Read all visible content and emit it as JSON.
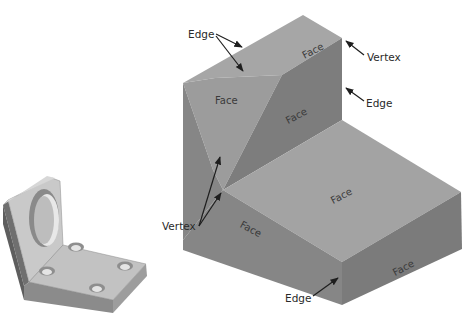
{
  "figure": {
    "colors": {
      "top_face": "#a6a6a6",
      "front_face_light": "#9a9a9a",
      "side_face_dark": "#7c7c7c",
      "bottom_front": "#858585",
      "bottom_right": "#7a7a7a",
      "lower_top": "#a3a3a3",
      "arrow": "#1e1e1e"
    }
  },
  "labels": {
    "edge_top": "Edge",
    "vertex_top_right": "Vertex",
    "edge_right": "Edge",
    "vertex_left": "Vertex",
    "edge_bottom": "Edge"
  },
  "faces": {
    "upper_top": "Face",
    "upper_left": "Face",
    "upper_right": "Face",
    "lower_top": "Face",
    "lower_left": "Face",
    "lower_right": "Face"
  },
  "bracket": {
    "holes": 4,
    "bore": 1
  }
}
